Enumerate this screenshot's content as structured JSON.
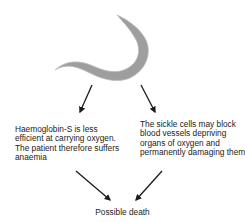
{
  "diagram": {
    "subject": "Sickle cell",
    "icon": "sickle-cell-icon",
    "colors": {
      "cell_fill": "#9e9e9e",
      "cell_edge": "#bdbdbd",
      "arrow": "#1a1a1a"
    },
    "nodes": [
      {
        "id": "anaemia",
        "label": "Haemoglobin-S  is less efficient at carrying oxygen. The patient therefore suffers anaemia"
      },
      {
        "id": "blockage",
        "label": "The sickle cells may block blood vessels depriving organs of oxygen and permanently damaging them"
      },
      {
        "id": "outcome",
        "label": "Possible death"
      }
    ],
    "edges": [
      {
        "from": "sickle-cell",
        "to": "anaemia"
      },
      {
        "from": "sickle-cell",
        "to": "blockage"
      },
      {
        "from": "anaemia",
        "to": "outcome"
      },
      {
        "from": "blockage",
        "to": "outcome"
      }
    ]
  }
}
